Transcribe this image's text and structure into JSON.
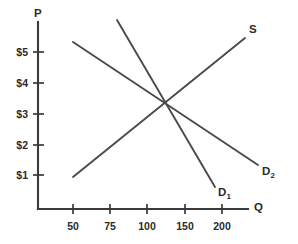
{
  "chart_data": {
    "type": "line",
    "title": "",
    "subtitle": "",
    "xlabel": "Q",
    "ylabel": "P",
    "grid": false,
    "legend_position": "inline-curve-labels",
    "annotations": [
      "Supply curve S intersects D1 at Q=100, P=$3",
      "Supply curve S intersects D2 at Q=150, P=$4"
    ],
    "x_axis": {
      "label": "Q",
      "tick_labels": [
        "50",
        "75",
        "100",
        "150",
        "200"
      ],
      "tick_values": [
        50,
        75,
        100,
        150,
        200
      ],
      "tick_pixel_x": [
        73,
        110,
        147,
        185,
        222
      ],
      "origin_pixel_x": 38,
      "end_pixel_x": 248
    },
    "y_axis": {
      "label": "P",
      "tick_labels": [
        "$1",
        "$2",
        "$3",
        "$4",
        "$5"
      ],
      "tick_values": [
        1,
        2,
        3,
        4,
        5
      ],
      "tick_pixel_y": [
        175,
        145,
        114,
        83,
        52
      ],
      "origin_pixel_y": 209,
      "top_pixel_y": 22
    },
    "series": [
      {
        "name": "S",
        "label": "S",
        "label_base": "S",
        "label_sub": "",
        "role": "supply",
        "slope": "upward",
        "endpoints_data": [
          {
            "q": 50,
            "p": 1.0
          },
          {
            "q": 282,
            "p": 5.55
          }
        ],
        "endpoints_pixel": [
          {
            "x": 73,
            "y": 177
          },
          {
            "x": 245,
            "y": 38
          }
        ],
        "label_pixel": {
          "x": 249,
          "y": 24
        }
      },
      {
        "name": "D1",
        "label": "D1",
        "label_base": "D",
        "label_sub": "1",
        "role": "demand",
        "slope": "downward",
        "endpoints_data": [
          {
            "q": 79,
            "p": 6.15
          },
          {
            "q": 212,
            "p": 0.72
          }
        ],
        "endpoints_pixel": [
          {
            "x": 117,
            "y": 20
          },
          {
            "x": 215,
            "y": 187
          }
        ],
        "label_pixel": {
          "x": 218,
          "y": 187
        }
      },
      {
        "name": "D2",
        "label": "D2",
        "label_base": "D",
        "label_sub": "2",
        "role": "demand",
        "slope": "downward",
        "endpoints_data": [
          {
            "q": 50,
            "p": 5.33
          },
          {
            "q": 299,
            "p": 1.32
          }
        ],
        "endpoints_pixel": [
          {
            "x": 73,
            "y": 42
          },
          {
            "x": 258,
            "y": 165
          }
        ],
        "label_pixel": {
          "x": 262,
          "y": 166
        }
      }
    ],
    "equilibria": [
      {
        "curves": [
          "S",
          "D1"
        ],
        "q": 100,
        "p": 3,
        "pixel": {
          "x": 147,
          "y": 114
        }
      },
      {
        "curves": [
          "S",
          "D2"
        ],
        "q": 150,
        "p": 4,
        "pixel": {
          "x": 186,
          "y": 84
        }
      }
    ],
    "colors": {
      "background": "#ffffff",
      "axis": "#3a3a3a",
      "curve": "#4a4a4a",
      "text": "#2b2b2b"
    }
  }
}
